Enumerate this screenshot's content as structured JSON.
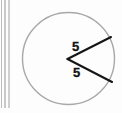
{
  "figure": {
    "type": "geometry-diagram",
    "background_color": "#fdfdfd",
    "circle": {
      "name": "circle-outline",
      "center_x": 68.5,
      "center_y": 58.5,
      "radius": 46,
      "stroke_color": "#a8a8a8",
      "stroke_width": 1.4,
      "fill": "none"
    },
    "vertex": {
      "name": "angle-vertex",
      "x": 67.5,
      "y": 59
    },
    "radii": [
      {
        "name": "upper-radius",
        "label": "5",
        "x1": 67.5,
        "y1": 59,
        "x2": 111,
        "y2": 37,
        "stroke_color": "#161616",
        "stroke_width": 2.1
      },
      {
        "name": "lower-radius",
        "label": "5",
        "x1": 67.5,
        "y1": 59,
        "x2": 112,
        "y2": 82,
        "stroke_color": "#161616",
        "stroke_width": 2.1
      }
    ],
    "labels": {
      "upper": "5",
      "lower": "5"
    },
    "scan_artifacts": {
      "name": "page-edge-lines",
      "count": 3,
      "color": "#c6c6c6"
    }
  }
}
